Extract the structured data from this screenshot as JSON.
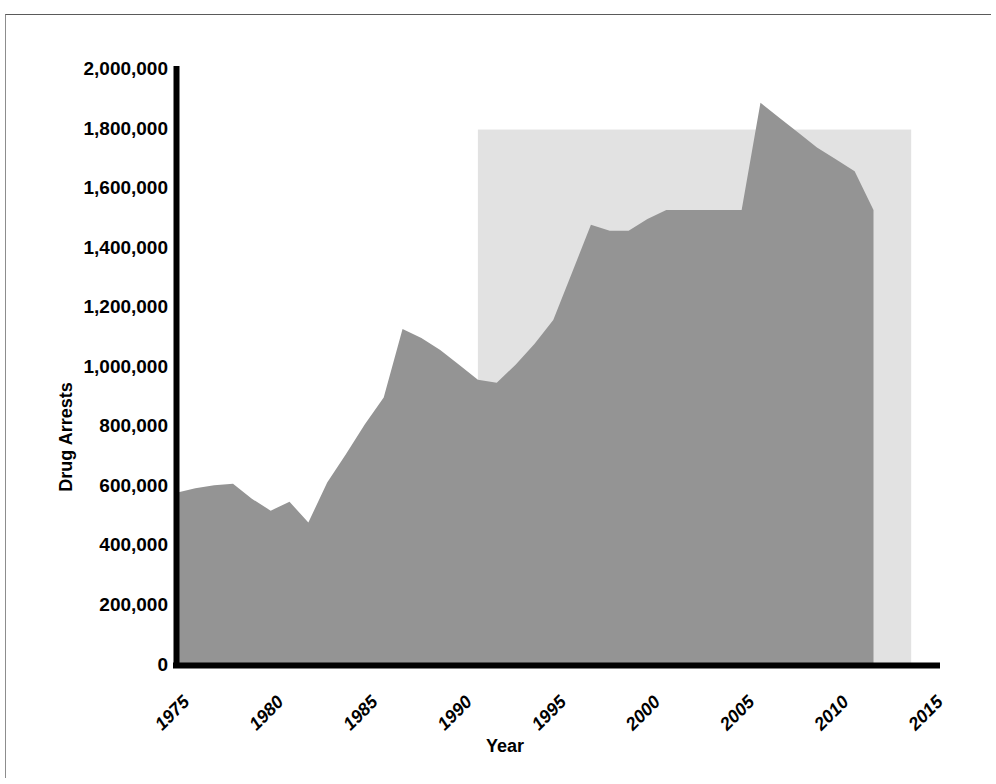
{
  "chart_data": {
    "type": "area",
    "title": "",
    "xlabel": "Year",
    "ylabel": "Drug Arrests",
    "xlim": [
      1975,
      2015
    ],
    "ylim": [
      0,
      2000000
    ],
    "grid": false,
    "legend": null,
    "x_tick_labels": [
      "1975",
      "1980",
      "1985",
      "1990",
      "1995",
      "2000",
      "2005",
      "2010",
      "2015"
    ],
    "x_tick_values": [
      1975,
      1980,
      1985,
      1990,
      1995,
      2000,
      2005,
      2010,
      2015
    ],
    "y_tick_labels": [
      "0",
      "200,000",
      "400,000",
      "600,000",
      "800,000",
      "1,000,000",
      "1,200,000",
      "1,400,000",
      "1,600,000",
      "1,800,000",
      "2,000,000"
    ],
    "y_tick_values": [
      0,
      200000,
      400000,
      600000,
      800000,
      1000000,
      1200000,
      1400000,
      1600000,
      1800000,
      2000000
    ],
    "series": [
      {
        "name": "Drug Arrests",
        "color": "#949494",
        "x": [
          1975,
          1976,
          1977,
          1978,
          1979,
          1980,
          1981,
          1982,
          1983,
          1984,
          1985,
          1986,
          1987,
          1988,
          1989,
          1990,
          1991,
          1992,
          1993,
          1994,
          1995,
          1996,
          1997,
          1998,
          1999,
          2000,
          2001,
          2002,
          2003,
          2004,
          2005,
          2006,
          2007,
          2008,
          2009,
          2010,
          2011,
          2012
        ],
        "values": [
          580000,
          595000,
          605000,
          610000,
          560000,
          520000,
          550000,
          480000,
          615000,
          710000,
          810000,
          900000,
          1130000,
          1100000,
          1060000,
          1010000,
          960000,
          950000,
          1010000,
          1080000,
          1160000,
          1320000,
          1480000,
          1460000,
          1460000,
          1500000,
          1530000,
          1530000,
          1530000,
          1530000,
          1530000,
          1890000,
          1840000,
          1790000,
          1740000,
          1700000,
          1660000,
          1530000
        ]
      }
    ],
    "shaded_region": {
      "name": "highlight-band",
      "color": "#e2e2e2",
      "x_start": 1991,
      "x_end": 2014,
      "y_top": 1800000,
      "y_bottom": 0
    }
  }
}
